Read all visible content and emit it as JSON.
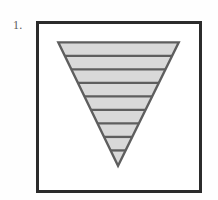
{
  "figure": {
    "item_number_label": "1.",
    "panel": {
      "background_color": "#ffffff",
      "border_color": "#2b2b2b",
      "border_width_px": 3
    },
    "page_background_color": "#fefefe"
  },
  "chart_data": {
    "type": "diagram",
    "title": "",
    "subtitle": "",
    "xlabel": "",
    "ylabel": "",
    "grid": false,
    "legend": "none",
    "shape": {
      "name": "inverted-triangle",
      "orientation": "point-down",
      "fill_color": "#d9d9d9",
      "outline_color": "#5e5e5e",
      "outline_width_px": 2.4,
      "stripe_color": "#5e5e5e",
      "stripe_width_px": 2.4,
      "stripe_line_count": 8,
      "band_count": 9,
      "vertices": [
        {
          "x": 20,
          "y": 19
        },
        {
          "x": 145,
          "y": 19
        },
        {
          "x": 82,
          "y": 147
        }
      ],
      "stripe_y_positions": [
        33,
        47,
        61,
        75,
        89,
        103,
        117,
        131
      ]
    },
    "viewbox": {
      "width": 166,
      "height": 172
    }
  }
}
